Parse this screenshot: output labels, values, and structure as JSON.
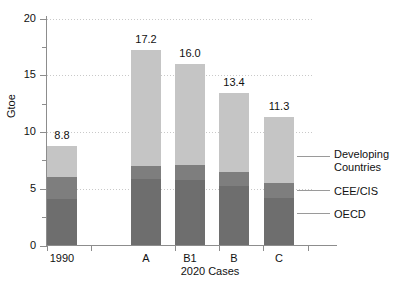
{
  "chart_data": {
    "type": "bar",
    "subtype": "stacked-bar",
    "title": "",
    "xlabel": "2020 Cases",
    "ylabel": "Gtoe",
    "categories": [
      "1990",
      "A",
      "B1",
      "B",
      "C"
    ],
    "ylim": [
      0,
      20
    ],
    "yticks": [
      0,
      5,
      10,
      15,
      20
    ],
    "ytick_labels": [
      "0",
      "5",
      "10",
      "15",
      "20"
    ],
    "yminor_ticks": [
      2.5,
      7.5,
      12.5,
      17.5
    ],
    "grid": "horizontal-dashed",
    "legend_position": "right-outside",
    "series": [
      {
        "name": "OECD",
        "values": [
          4.1,
          5.9,
          5.8,
          5.2,
          4.2
        ]
      },
      {
        "name": "CEE/CIS",
        "values": [
          1.9,
          1.1,
          1.3,
          1.3,
          1.3
        ]
      },
      {
        "name": "Developing Countries",
        "values": [
          2.8,
          10.2,
          8.9,
          6.9,
          5.8
        ]
      }
    ],
    "totals": [
      8.8,
      17.2,
      16.0,
      13.4,
      11.3
    ],
    "total_labels": [
      "8.8",
      "17.2",
      "16.0",
      "13.4",
      "11.3"
    ],
    "colors": {
      "oecd": "#6e6e6e",
      "cee_cis": "#7e7e7e",
      "developing": "#c5c5c5",
      "axis": "#8d8d8d",
      "grid": "#c9c9c9",
      "text": "#111111"
    }
  },
  "legend": {
    "items": [
      {
        "label": "Developing\nCountries",
        "key": "developing"
      },
      {
        "label": "CEE/CIS",
        "key": "cee_cis"
      },
      {
        "label": "OECD",
        "key": "oecd"
      }
    ]
  }
}
